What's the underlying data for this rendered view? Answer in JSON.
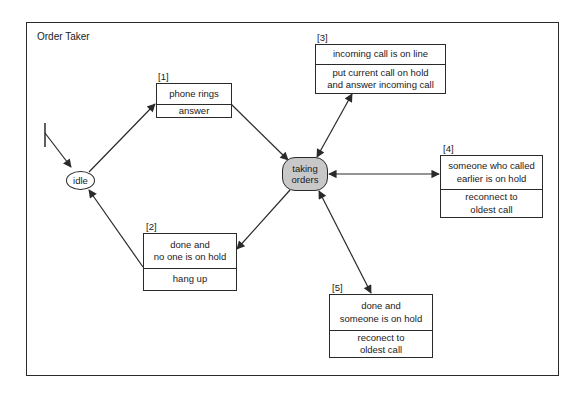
{
  "diagram": {
    "title": "Order Taker",
    "type": "state-transition",
    "states": [
      {
        "id": "idle",
        "label": "idle",
        "shape": "ellipse",
        "fill": "#ffffff"
      },
      {
        "id": "taking",
        "label": "taking\norders",
        "shape": "rounded-rect",
        "fill": "#c8c8c8"
      }
    ],
    "transitions": [
      {
        "id": "1",
        "tag": "[1]",
        "condition": "phone rings",
        "action": "answer",
        "from": "idle",
        "to": "taking"
      },
      {
        "id": "2",
        "tag": "[2]",
        "condition": "done and\nno one is on hold",
        "action": "hang up",
        "from": "taking",
        "to": "idle"
      },
      {
        "id": "3",
        "tag": "[3]",
        "condition": "incoming call is on line",
        "action": "put current call on hold\nand answer incoming call",
        "from": "taking",
        "to": "taking"
      },
      {
        "id": "4",
        "tag": "[4]",
        "condition": "someone who called\nearlier is on hold",
        "action": "reconnect to\noldest call",
        "from": "taking",
        "to": "taking"
      },
      {
        "id": "5",
        "tag": "[5]",
        "condition": "done and\nsomeone is on hold",
        "action": "reconect to\noldest call",
        "from": "taking",
        "to": "taking"
      }
    ],
    "colors": {
      "line": "#2a2a2a",
      "state_active_fill": "#c8c8c8",
      "background": "#ffffff"
    }
  }
}
